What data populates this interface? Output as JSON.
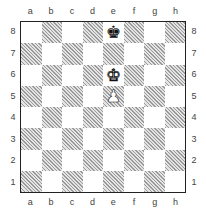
{
  "board": {
    "files": [
      "a",
      "b",
      "c",
      "d",
      "e",
      "f",
      "g",
      "h"
    ],
    "ranks": [
      "8",
      "7",
      "6",
      "5",
      "4",
      "3",
      "2",
      "1"
    ],
    "colors": {
      "light": "#ffffff",
      "dark_hatch": "#9a9a9a",
      "border": "#222222"
    },
    "pieces": [
      {
        "square": "e8",
        "color": "black",
        "type": "king",
        "glyph": "♚"
      },
      {
        "square": "e6",
        "color": "white",
        "type": "king",
        "glyph": "♚"
      },
      {
        "square": "e5",
        "color": "white",
        "type": "pawn",
        "glyph": "♟"
      }
    ]
  }
}
